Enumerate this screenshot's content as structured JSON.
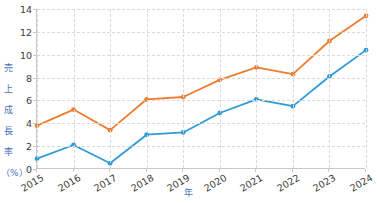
{
  "chart_data": {
    "type": "line",
    "title": "",
    "xlabel": "年",
    "ylabel": "売上成長率（%）",
    "ylabel_chars": [
      "売",
      "上",
      "成",
      "長",
      "率",
      "（%）"
    ],
    "categories": [
      "2015",
      "2016",
      "2017",
      "2018",
      "2019",
      "2020",
      "2021",
      "2022",
      "2023",
      "2024"
    ],
    "x": [
      2015,
      2016,
      2017,
      2018,
      2019,
      2020,
      2021,
      2022,
      2023,
      2024
    ],
    "xlim": [
      2015,
      2024
    ],
    "ylim": [
      0,
      14
    ],
    "yticks": [
      0,
      2,
      4,
      6,
      8,
      10,
      12,
      14
    ],
    "ytick_labels": [
      "0",
      "2",
      "4",
      "6",
      "8",
      "10",
      "12",
      "14"
    ],
    "grid": true,
    "grid_style": "dashed",
    "legend": "none",
    "markers": "circle",
    "series": [
      {
        "name": "series-orange",
        "color": "#ed7d31",
        "values": [
          3.8,
          5.2,
          3.4,
          6.1,
          6.3,
          7.8,
          8.9,
          8.3,
          11.2,
          13.4
        ]
      },
      {
        "name": "series-blue",
        "color": "#2e9bd6",
        "values": [
          0.9,
          2.1,
          0.5,
          3.0,
          3.2,
          4.9,
          6.1,
          5.5,
          8.1,
          10.4
        ]
      }
    ]
  },
  "colors": {
    "axis": "#c8c8c8",
    "grid": "#d9d9d9",
    "tick_text": "#3a3a3a",
    "axis_title": "#4a72b8",
    "background": "#ffffff"
  }
}
